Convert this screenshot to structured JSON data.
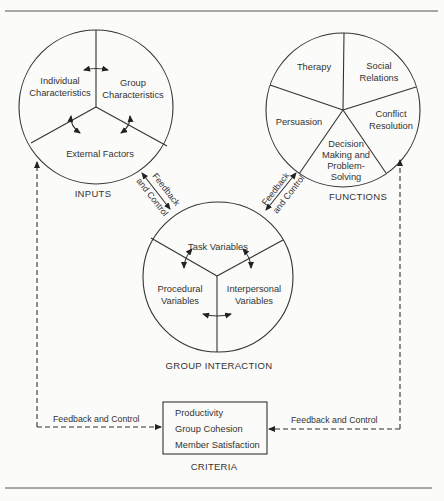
{
  "inputs": {
    "caption": "INPUTS",
    "segments": {
      "individual_1": "Individual",
      "individual_2": "Characteristics",
      "group_1": "Group",
      "group_2": "Characteristics",
      "external": "External Factors"
    }
  },
  "functions": {
    "caption": "FUNCTIONS",
    "segments": {
      "therapy": "Therapy",
      "social_1": "Social",
      "social_2": "Relations",
      "conflict_1": "Conflict",
      "conflict_2": "Resolution",
      "persuasion": "Persuasion",
      "decision_1": "Decision",
      "decision_2": "Making and",
      "decision_3": "Problem-",
      "decision_4": "Solving"
    }
  },
  "group_interaction": {
    "caption": "GROUP INTERACTION",
    "segments": {
      "task": "Task Variables",
      "procedural_1": "Procedural",
      "procedural_2": "Variables",
      "interpersonal_1": "Interpersonal",
      "interpersonal_2": "Variables"
    }
  },
  "criteria": {
    "caption": "CRITERIA",
    "items": [
      "Productivity",
      "Group Cohesion",
      "Member Satisfaction"
    ]
  },
  "feedback": {
    "left_diag_1": "Feedback",
    "left_diag_2": "and Control",
    "right_diag_1": "Feedback",
    "right_diag_2": "and Control",
    "bottom_left": "Feedback and Control",
    "bottom_right": "Feedback and Control"
  }
}
